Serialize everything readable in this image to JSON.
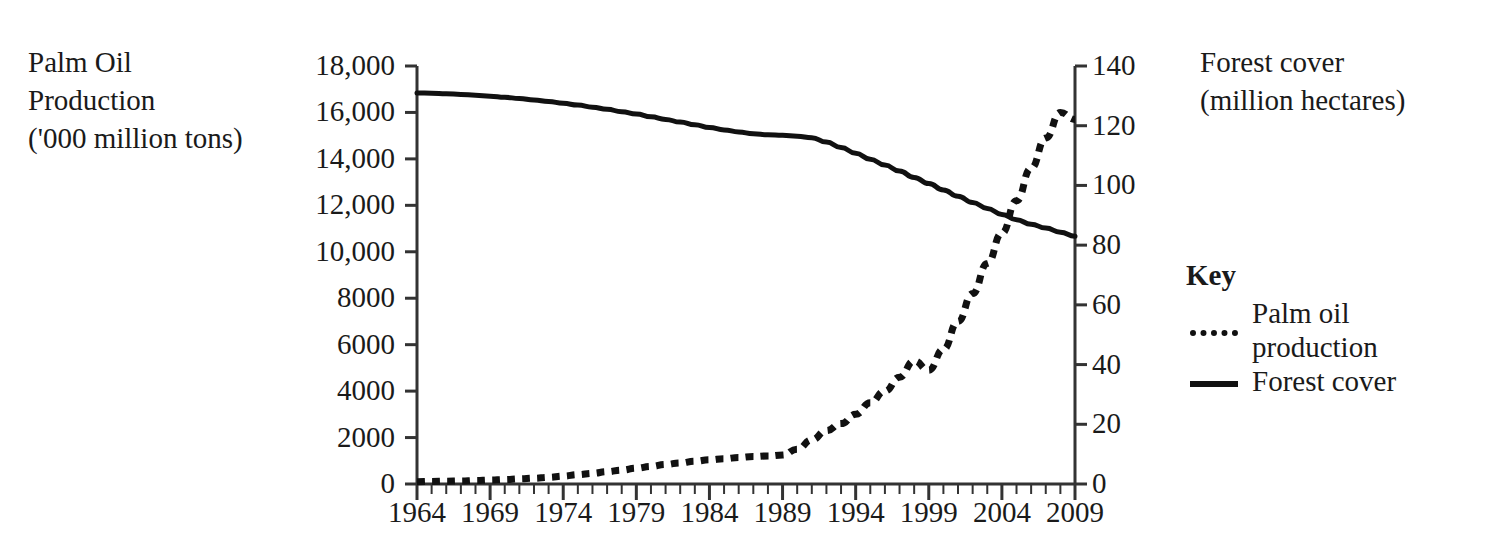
{
  "chart_data": {
    "type": "line",
    "title": "",
    "xlabel": "",
    "grid": false,
    "legend_position": "right",
    "x": [
      1964,
      1965,
      1966,
      1967,
      1968,
      1969,
      1970,
      1971,
      1972,
      1973,
      1974,
      1975,
      1976,
      1977,
      1978,
      1979,
      1980,
      1981,
      1982,
      1983,
      1984,
      1985,
      1986,
      1987,
      1988,
      1989,
      1990,
      1991,
      1992,
      1993,
      1994,
      1995,
      1996,
      1997,
      1998,
      1999,
      2000,
      2001,
      2002,
      2003,
      2004,
      2005,
      2006,
      2007,
      2008,
      2009
    ],
    "xlim": [
      1964,
      2009
    ],
    "x_tick_labels": [
      "1964",
      "1969",
      "1974",
      "1979",
      "1984",
      "1989",
      "1994",
      "1999",
      "2004",
      "2009"
    ],
    "x_major_step": 5,
    "x_minor_step": 1,
    "axes": [
      {
        "id": "left",
        "label": "Palm Oil\nProduction\n('000 million tons)",
        "ylim": [
          0,
          18000
        ],
        "ytick_step": 2000,
        "ytick_labels": [
          "0",
          "2000",
          "4000",
          "6000",
          "8000",
          "10,000",
          "12,000",
          "14,000",
          "16,000",
          "18,000"
        ],
        "ytick_values": [
          0,
          2000,
          4000,
          6000,
          8000,
          10000,
          12000,
          14000,
          16000,
          18000
        ]
      },
      {
        "id": "right",
        "label": "Forest cover\n(million hectares)",
        "ylim": [
          0,
          140
        ],
        "ytick_step": 20,
        "ytick_labels": [
          "0",
          "20",
          "40",
          "60",
          "80",
          "100",
          "120",
          "140"
        ],
        "ytick_values": [
          0,
          20,
          40,
          60,
          80,
          100,
          120,
          140
        ]
      }
    ],
    "series": [
      {
        "name": "Palm oil production",
        "axis": "left",
        "style": "dotted",
        "color": "#111111",
        "unit": "'000 million tons",
        "values": [
          100,
          110,
          120,
          130,
          150,
          170,
          190,
          220,
          250,
          290,
          340,
          400,
          460,
          530,
          600,
          680,
          760,
          840,
          910,
          980,
          1040,
          1090,
          1140,
          1180,
          1210,
          1250,
          1500,
          1900,
          2300,
          2600,
          3000,
          3500,
          4000,
          4600,
          5300,
          4900,
          5800,
          7000,
          8200,
          9500,
          10800,
          12200,
          13600,
          14900,
          16000,
          15700
        ]
      },
      {
        "name": "Forest cover",
        "axis": "right",
        "style": "solid",
        "color": "#111111",
        "unit": "million hectares",
        "values": [
          131,
          130.9,
          130.7,
          130.5,
          130.2,
          129.9,
          129.5,
          129.1,
          128.6,
          128.1,
          127.5,
          126.9,
          126.2,
          125.5,
          124.7,
          123.9,
          123.0,
          122.1,
          121.2,
          120.3,
          119.4,
          118.6,
          117.9,
          117.3,
          117.0,
          116.8,
          116.5,
          116.0,
          114.5,
          112.7,
          110.8,
          108.8,
          106.8,
          104.8,
          102.7,
          100.6,
          98.5,
          96.4,
          94.3,
          92.3,
          90.3,
          88.5,
          87.0,
          85.7,
          84.3,
          83.0
        ]
      }
    ]
  },
  "legend": {
    "title": "Key",
    "entries": [
      {
        "label": "Palm oil\nproduction",
        "style": "dotted"
      },
      {
        "label": "Forest cover",
        "style": "solid"
      }
    ]
  }
}
